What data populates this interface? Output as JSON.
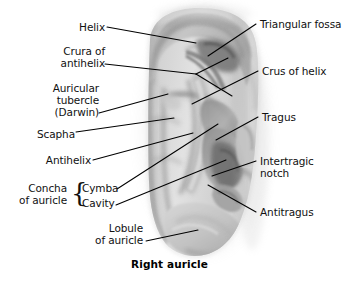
{
  "figure": {
    "title": "Right auricle",
    "caption": "Right auricle",
    "background_color": "#ffffff",
    "text_color": "#111111",
    "leader_line_color": "#000000",
    "width": 361,
    "height": 283
  },
  "labels": {
    "left": [
      {
        "id": "helix",
        "text": "Helix",
        "lines": [
          "Helix"
        ]
      },
      {
        "id": "crura-of-antihelix",
        "text": "Crura of antihelix",
        "lines": [
          "Crura of",
          "antihelix"
        ]
      },
      {
        "id": "auricular-tubercle-darwin",
        "text": "Auricular tubercle (Darwin)",
        "lines": [
          "Auricular",
          "tubercle",
          "(Darwin)"
        ]
      },
      {
        "id": "scapha",
        "text": "Scapha",
        "lines": [
          "Scapha"
        ]
      },
      {
        "id": "antihelix",
        "text": "Antihelix",
        "lines": [
          "Antihelix"
        ]
      },
      {
        "id": "concha-of-auricle",
        "text": "Concha of auricle",
        "lines": [
          "Concha",
          "of auricle"
        ]
      },
      {
        "id": "cymba",
        "text": "Cymba",
        "lines": [
          "Cymba"
        ]
      },
      {
        "id": "cavity",
        "text": "Cavity",
        "lines": [
          "Cavity"
        ]
      },
      {
        "id": "lobule-of-auricle",
        "text": "Lobule of auricle",
        "lines": [
          "Lobule",
          "of auricle"
        ]
      }
    ],
    "right": [
      {
        "id": "triangular-fossa",
        "text": "Triangular fossa",
        "lines": [
          "Triangular fossa"
        ]
      },
      {
        "id": "crus-of-helix",
        "text": "Crus of helix",
        "lines": [
          "Crus of helix"
        ]
      },
      {
        "id": "tragus",
        "text": "Tragus",
        "lines": [
          "Tragus"
        ]
      },
      {
        "id": "intertragic-notch",
        "text": "Intertragic notch",
        "lines": [
          "Intertragic",
          "notch"
        ]
      },
      {
        "id": "antitragus",
        "text": "Antitragus",
        "lines": [
          "Antitragus"
        ]
      }
    ],
    "brace_symbol": "{"
  },
  "text": {
    "helix": "Helix",
    "crura_of_1": "Crura of",
    "crura_of_2": "antihelix",
    "auricular_1": "Auricular",
    "auricular_2": "tubercle",
    "auricular_3": "(Darwin)",
    "scapha": "Scapha",
    "antihelix": "Antihelix",
    "concha_1": "Concha",
    "concha_2": "of auricle",
    "cymba": "Cymba",
    "cavity": "Cavity",
    "lobule_1": "Lobule",
    "lobule_2": "of auricle",
    "triangular_fossa": "Triangular fossa",
    "crus_of_helix": "Crus of helix",
    "tragus": "Tragus",
    "intertragic_1": "Intertragic",
    "intertragic_2": "notch",
    "antitragus": "Antitragus",
    "brace": "{",
    "caption": "Right auricle"
  }
}
